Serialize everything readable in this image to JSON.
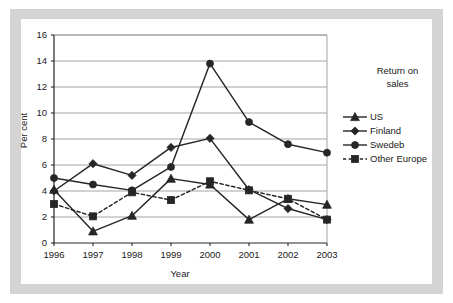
{
  "chart_data": {
    "type": "line",
    "title": "",
    "xlabel": "Year",
    "ylabel": "Per cent",
    "categories": [
      "1996",
      "1997",
      "1998",
      "1999",
      "2000",
      "2001",
      "2002",
      "2003"
    ],
    "x": [
      1996,
      1997,
      1998,
      1999,
      2000,
      2001,
      2002,
      2003
    ],
    "xlim": [
      1996,
      2003
    ],
    "ylim": [
      0,
      16
    ],
    "yticks": [
      0,
      2,
      4,
      6,
      8,
      10,
      12,
      14,
      16
    ],
    "grid": "horizontal",
    "legend_position": "right",
    "legend_title": "Return on sales",
    "series": [
      {
        "name": "US",
        "marker": "triangle",
        "linestyle": "solid",
        "color": "#262626",
        "values": [
          4.1,
          0.9,
          2.1,
          4.95,
          4.5,
          1.8,
          3.4,
          2.95
        ]
      },
      {
        "name": "Finland",
        "marker": "diamond",
        "linestyle": "solid",
        "color": "#262626",
        "values": [
          4.0,
          6.1,
          5.2,
          7.35,
          8.05,
          4.1,
          2.65,
          1.8
        ]
      },
      {
        "name": "Swedeb",
        "marker": "circle",
        "linestyle": "solid",
        "color": "#262626",
        "values": [
          5.0,
          4.5,
          4.05,
          5.85,
          13.8,
          9.3,
          7.6,
          6.95
        ]
      },
      {
        "name": "Other Europe",
        "marker": "square",
        "linestyle": "dashed",
        "color": "#262626",
        "values": [
          3.0,
          2.05,
          3.9,
          3.3,
          4.75,
          4.05,
          3.4,
          1.8
        ]
      }
    ]
  },
  "legend": {
    "title_line1": "Return on",
    "title_line2": "sales",
    "entries": [
      {
        "label": "US"
      },
      {
        "label": "Finland"
      },
      {
        "label": "Swedeb"
      },
      {
        "label": "Other Europe"
      }
    ]
  },
  "axes": {
    "y_title": "Per cent",
    "x_title": "Year",
    "y_ticks": [
      "16",
      "14",
      "12",
      "10",
      "8",
      "6",
      "4",
      "2",
      "0"
    ],
    "x_ticks": [
      "1996",
      "1997",
      "1998",
      "1999",
      "2000",
      "2001",
      "2002",
      "2003"
    ]
  },
  "colors": {
    "ink": "#262626",
    "grid": "#9a9a9a",
    "frame": "#d4d4d4",
    "plot_bg": "#ffffff"
  }
}
